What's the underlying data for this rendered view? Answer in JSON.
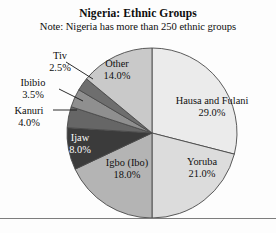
{
  "chart_data": {
    "type": "pie",
    "title": "Nigeria: Ethnic Groups",
    "subtitle": "Note: Nigeria has more than 250 ethnic groups",
    "xlabel": "",
    "ylabel": "",
    "legend_position": "none",
    "grid": false,
    "labels_show_percent": true,
    "categories": [
      "Hausa and Fulani",
      "Yoruba",
      "Igbo (Ibo)",
      "Ijaw",
      "Kanuri",
      "Ibibio",
      "Tiv",
      "Other"
    ],
    "values": [
      29.0,
      21.0,
      18.0,
      8.0,
      4.0,
      3.5,
      2.5,
      14.0
    ],
    "total": 100.0,
    "slices": [
      {
        "name": "Hausa and Fulani",
        "value": 29.0,
        "label": "Hausa and Fulani",
        "percent_label": "29.0%",
        "color": "#ebebeb",
        "label_placement": "inside",
        "text_color": "dark"
      },
      {
        "name": "Yoruba",
        "value": 21.0,
        "label": "Yoruba",
        "percent_label": "21.0%",
        "color": "#dcdcdc",
        "label_placement": "inside",
        "text_color": "dark"
      },
      {
        "name": "Igbo (Ibo)",
        "value": 18.0,
        "label": "Igbo (Ibo)",
        "percent_label": "18.0%",
        "color": "#b4b4b4",
        "label_placement": "inside",
        "text_color": "dark"
      },
      {
        "name": "Ijaw",
        "value": 8.0,
        "label": "Ijaw",
        "percent_label": "8.0%",
        "color": "#3b3b3b",
        "label_placement": "inside",
        "text_color": "light"
      },
      {
        "name": "Kanuri",
        "value": 4.0,
        "label": "Kanuri",
        "percent_label": "4.0%",
        "color": "#666666",
        "label_placement": "outside",
        "text_color": "dark"
      },
      {
        "name": "Ibibio",
        "value": 3.5,
        "label": "Ibibio",
        "percent_label": "3.5%",
        "color": "#8f8f8f",
        "label_placement": "outside",
        "text_color": "dark"
      },
      {
        "name": "Tiv",
        "value": 2.5,
        "label": "Tiv",
        "percent_label": "2.5%",
        "color": "#6e6e6e",
        "label_placement": "outside",
        "text_color": "dark"
      },
      {
        "name": "Other",
        "value": 14.0,
        "label": "Other",
        "percent_label": "14.0%",
        "color": "#c9c9c9",
        "label_placement": "inside",
        "text_color": "dark"
      }
    ],
    "geometry": {
      "center_x": 152,
      "center_y": 133,
      "radius": 85,
      "start_angle_deg": -90,
      "direction": "clockwise"
    },
    "colors": {
      "outline": "#4a4a4a",
      "leader_line": "#151515",
      "baseline": "#7d7d7d",
      "background": "#fdfdfd",
      "text": "#0d0d0d"
    }
  }
}
